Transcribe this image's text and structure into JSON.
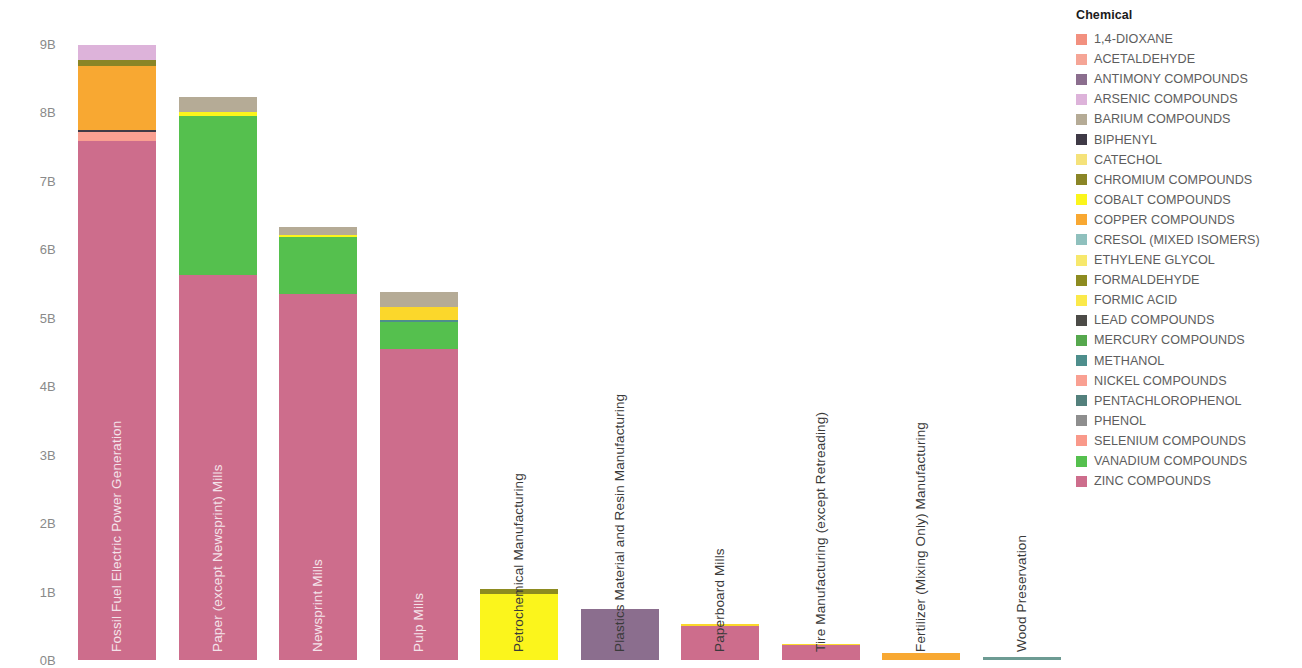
{
  "axis": {
    "y_title": "Ecotoxicity (CTUe)",
    "ticks": [
      "9B",
      "8B",
      "7B",
      "6B",
      "5B",
      "4B",
      "3B",
      "2B",
      "1B",
      "0B"
    ]
  },
  "legend": {
    "title": "Chemical",
    "items": [
      {
        "label": "1,4-DIOXANE",
        "color": "#f2907f"
      },
      {
        "label": "ACETALDEHYDE",
        "color": "#f5a596"
      },
      {
        "label": "ANTIMONY COMPOUNDS",
        "color": "#8b6e8e"
      },
      {
        "label": "ARSENIC COMPOUNDS",
        "color": "#ddb3da"
      },
      {
        "label": "BARIUM COMPOUNDS",
        "color": "#b5ab96"
      },
      {
        "label": "BIPHENYL",
        "color": "#3f3a46"
      },
      {
        "label": "CATECHOL",
        "color": "#f5e27a"
      },
      {
        "label": "CHROMIUM COMPOUNDS",
        "color": "#8a8526"
      },
      {
        "label": "COBALT COMPOUNDS",
        "color": "#fbf51c"
      },
      {
        "label": "COPPER COMPOUNDS",
        "color": "#f8a832"
      },
      {
        "label": "CRESOL (MIXED ISOMERS)",
        "color": "#8fc0bd"
      },
      {
        "label": "ETHYLENE GLYCOL",
        "color": "#f7e86c"
      },
      {
        "label": "FORMALDEHYDE",
        "color": "#8d8b20"
      },
      {
        "label": "FORMIC ACID",
        "color": "#fbe94a"
      },
      {
        "label": "LEAD COMPOUNDS",
        "color": "#4c4b47"
      },
      {
        "label": "MERCURY COMPOUNDS",
        "color": "#56a84e"
      },
      {
        "label": "METHANOL",
        "color": "#4e8e8c"
      },
      {
        "label": "NICKEL COMPOUNDS",
        "color": "#f9a092"
      },
      {
        "label": "PENTACHLOROPHENOL",
        "color": "#53807c"
      },
      {
        "label": "PHENOL",
        "color": "#8e8e8e"
      },
      {
        "label": "SELENIUM COMPOUNDS",
        "color": "#f9998a"
      },
      {
        "label": "VANADIUM COMPOUNDS",
        "color": "#55c04e"
      },
      {
        "label": "ZINC COMPOUNDS",
        "color": "#cd6d8c"
      }
    ]
  },
  "chart_data": {
    "type": "bar",
    "stacked": true,
    "title": "",
    "xlabel": "",
    "ylabel": "Ecotoxicity (CTUe)",
    "ylim": [
      0,
      9.3
    ],
    "ytick_values": [
      0,
      1,
      2,
      3,
      4,
      5,
      6,
      7,
      8,
      9
    ],
    "ytick_labels": [
      "0B",
      "1B",
      "2B",
      "3B",
      "4B",
      "5B",
      "6B",
      "7B",
      "8B",
      "9B"
    ],
    "grid": false,
    "legend_position": "right",
    "units": "billions of CTUe",
    "categories": [
      "Fossil Fuel Electric Power Generation",
      "Paper (except Newsprint) Mills",
      "Newsprint Mills",
      "Pulp Mills",
      "Petrochemical Manufacturing",
      "Plastics Material and Resin Manufacturing",
      "Paperboard Mills",
      "Tire Manufacturing (except Retreading)",
      "Fertilizer (Mixing Only) Manufacturing",
      "Wood Preservation"
    ],
    "totals": [
      8.98,
      8.22,
      6.33,
      5.37,
      1.04,
      0.74,
      0.52,
      0.24,
      0.1,
      0.04
    ],
    "series": [
      {
        "name": "ZINC COMPOUNDS",
        "color": "#cd6d8c",
        "values": [
          7.58,
          5.62,
          5.35,
          4.55,
          0,
          0,
          0.52,
          0.24,
          0,
          0
        ]
      },
      {
        "name": "SELENIUM COMPOUNDS",
        "color": "#f9998a",
        "values": [
          0.14,
          0,
          0,
          0,
          0,
          0,
          0,
          0,
          0,
          0
        ]
      },
      {
        "name": "BIPHENYL",
        "color": "#3f3a46",
        "values": [
          0.02,
          0,
          0,
          0,
          0,
          0,
          0,
          0,
          0,
          0
        ]
      },
      {
        "name": "COPPER COMPOUNDS",
        "color": "#f8a832",
        "values": [
          0.94,
          0,
          0,
          0,
          0,
          0,
          0,
          0,
          0.1,
          0
        ]
      },
      {
        "name": "CHROMIUM COMPOUNDS",
        "color": "#8a8526",
        "values": [
          0.08,
          0,
          0,
          0,
          0,
          0,
          0,
          0,
          0,
          0
        ]
      },
      {
        "name": "ARSENIC COMPOUNDS",
        "color": "#ddb3da",
        "values": [
          0.22,
          0,
          0,
          0,
          0,
          0,
          0,
          0,
          0,
          0
        ]
      },
      {
        "name": "VANADIUM COMPOUNDS",
        "color": "#55c04e",
        "values": [
          0,
          2.32,
          0.83,
          0.4,
          0,
          0,
          0,
          0,
          0,
          0
        ]
      },
      {
        "name": "METHANOL",
        "color": "#4e8e8c",
        "values": [
          0,
          0,
          0,
          0.01,
          0,
          0,
          0,
          0,
          0,
          0.04
        ]
      },
      {
        "name": "COBALT COMPOUNDS",
        "color": "#fbf51c",
        "values": [
          0,
          0.07,
          0.03,
          0.2,
          0.96,
          0,
          0,
          0,
          0,
          0
        ]
      },
      {
        "name": "BARIUM COMPOUNDS",
        "color": "#b5ab96",
        "values": [
          0,
          0.21,
          0.12,
          0.21,
          0,
          0,
          0,
          0,
          0,
          0
        ]
      },
      {
        "name": "FORMALDEHYDE",
        "color": "#8d8b20",
        "values": [
          0,
          0,
          0,
          0,
          0.08,
          0,
          0,
          0,
          0,
          0
        ]
      },
      {
        "name": "ANTIMONY COMPOUNDS",
        "color": "#8b6e8e",
        "values": [
          0,
          0,
          0,
          0,
          0,
          0.74,
          0,
          0,
          0,
          0
        ]
      }
    ]
  },
  "bars": [
    {
      "name": "Fossil Fuel Electric Power Generation",
      "label_style": "inside",
      "total": 8.98,
      "segments": [
        {
          "chemical": "ZINC COMPOUNDS",
          "value": 7.58,
          "color": "#cd6d8c"
        },
        {
          "chemical": "SELENIUM COMPOUNDS",
          "value": 0.14,
          "color": "#f9a092"
        },
        {
          "chemical": "BIPHENYL",
          "value": 0.02,
          "color": "#3f3a46"
        },
        {
          "chemical": "COPPER COMPOUNDS",
          "value": 0.94,
          "color": "#f8a832"
        },
        {
          "chemical": "CHROMIUM COMPOUNDS",
          "value": 0.08,
          "color": "#8a8526"
        },
        {
          "chemical": "ARSENIC COMPOUNDS",
          "value": 0.22,
          "color": "#ddb3da"
        }
      ]
    },
    {
      "name": "Paper (except Newsprint) Mills",
      "label_style": "inside",
      "total": 8.22,
      "segments": [
        {
          "chemical": "ZINC COMPOUNDS",
          "value": 5.62,
          "color": "#cd6d8c"
        },
        {
          "chemical": "VANADIUM COMPOUNDS",
          "value": 2.32,
          "color": "#55c04e"
        },
        {
          "chemical": "COBALT COMPOUNDS",
          "value": 0.07,
          "color": "#fbf51c"
        },
        {
          "chemical": "BARIUM COMPOUNDS",
          "value": 0.21,
          "color": "#b5ab96"
        }
      ]
    },
    {
      "name": "Newsprint Mills",
      "label_style": "inside",
      "total": 6.33,
      "segments": [
        {
          "chemical": "ZINC COMPOUNDS",
          "value": 5.35,
          "color": "#cd6d8c"
        },
        {
          "chemical": "VANADIUM COMPOUNDS",
          "value": 0.83,
          "color": "#55c04e"
        },
        {
          "chemical": "COBALT COMPOUNDS",
          "value": 0.03,
          "color": "#fbf51c"
        },
        {
          "chemical": "BARIUM COMPOUNDS",
          "value": 0.12,
          "color": "#b5ab96"
        }
      ]
    },
    {
      "name": "Pulp Mills",
      "label_style": "inside",
      "total": 5.37,
      "segments": [
        {
          "chemical": "ZINC COMPOUNDS",
          "value": 4.55,
          "color": "#cd6d8c"
        },
        {
          "chemical": "VANADIUM COMPOUNDS",
          "value": 0.4,
          "color": "#55c04e"
        },
        {
          "chemical": "METHANOL",
          "value": 0.01,
          "color": "#4e8e8c"
        },
        {
          "chemical": "COBALT COMPOUNDS",
          "value": 0.2,
          "color": "#fbd72b"
        },
        {
          "chemical": "BARIUM COMPOUNDS",
          "value": 0.21,
          "color": "#b5ab96"
        }
      ]
    },
    {
      "name": "Petrochemical Manufacturing",
      "label_style": "dark",
      "total": 1.04,
      "segments": [
        {
          "chemical": "COBALT COMPOUNDS",
          "value": 0.96,
          "color": "#fbf51c"
        },
        {
          "chemical": "FORMALDEHYDE",
          "value": 0.08,
          "color": "#8d8b20"
        }
      ]
    },
    {
      "name": "Plastics Material and Resin Manufacturing",
      "label_style": "dark",
      "total": 0.74,
      "segments": [
        {
          "chemical": "ANTIMONY COMPOUNDS",
          "value": 0.74,
          "color": "#8b6e8e"
        }
      ]
    },
    {
      "name": "Paperboard Mills",
      "label_style": "dark",
      "total": 0.52,
      "segments": [
        {
          "chemical": "ZINC COMPOUNDS",
          "value": 0.505,
          "color": "#cd6d8c"
        },
        {
          "chemical": "COBALT COMPOUNDS",
          "value": 0.015,
          "color": "#fbd72b"
        }
      ]
    },
    {
      "name": "Tire Manufacturing (except Retreading)",
      "label_style": "dark",
      "total": 0.24,
      "segments": [
        {
          "chemical": "ZINC COMPOUNDS",
          "value": 0.228,
          "color": "#cd6d8c"
        },
        {
          "chemical": "COBALT COMPOUNDS",
          "value": 0.012,
          "color": "#fbd72b"
        }
      ]
    },
    {
      "name": "Fertilizer (Mixing Only) Manufacturing",
      "label_style": "dark",
      "total": 0.1,
      "segments": [
        {
          "chemical": "COPPER COMPOUNDS",
          "value": 0.1,
          "color": "#f8a832"
        }
      ]
    },
    {
      "name": "Wood Preservation",
      "label_style": "dark",
      "total": 0.04,
      "segments": [
        {
          "chemical": "METHANOL",
          "value": 0.04,
          "color": "#6d9b93"
        }
      ]
    }
  ]
}
